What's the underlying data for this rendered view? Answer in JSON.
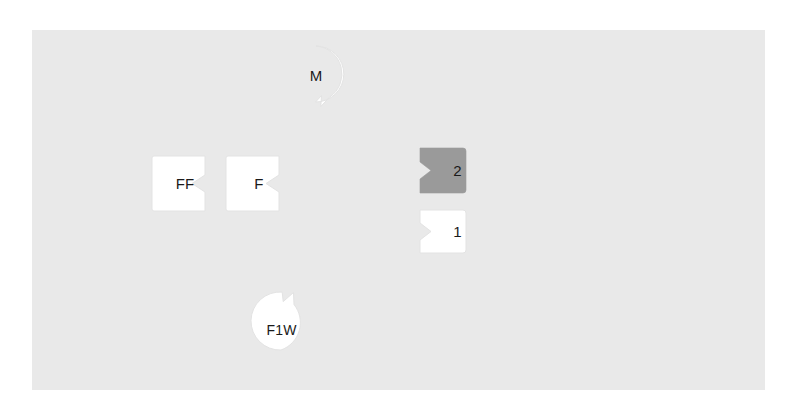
{
  "diagram": {
    "canvas": {
      "width": 798,
      "height": 417,
      "background_color": "#ffffff"
    },
    "panel": {
      "name": "diagram-panel",
      "fill_color": "#e9e9e9",
      "x": 32,
      "y": 30,
      "width": 733,
      "height": 360
    },
    "colors": {
      "panel": "#e9e9e9",
      "shape_white": "#ffffff",
      "shape_gray": "#9a9a9a",
      "shape_stroke": "#e0e0e0",
      "text": "#1a1a1a"
    },
    "nodes": [
      {
        "id": "m",
        "label": "M",
        "shape": "circle-notched-bottom-right",
        "fill": "#ffffff",
        "x": 286,
        "y": 44,
        "width": 60,
        "height": 63
      },
      {
        "id": "ff",
        "label": "FF",
        "shape": "rect-notch-right",
        "fill": "#ffffff",
        "x": 151,
        "y": 155,
        "width": 68,
        "height": 57
      },
      {
        "id": "f",
        "label": "F",
        "shape": "rect-notch-right",
        "fill": "#ffffff",
        "x": 225,
        "y": 155,
        "width": 68,
        "height": 57
      },
      {
        "id": "box2",
        "label": "2",
        "shape": "rect-notch-left",
        "fill": "#9a9a9a",
        "x": 420,
        "y": 147,
        "width": 47,
        "height": 47
      },
      {
        "id": "box1",
        "label": "1",
        "shape": "rect-notch-left",
        "fill": "#ffffff",
        "x": 420,
        "y": 209,
        "width": 47,
        "height": 45
      },
      {
        "id": "f1w",
        "label": "F1W",
        "shape": "circle-notched-top-right",
        "fill": "#ffffff",
        "x": 249,
        "y": 289,
        "width": 65,
        "height": 64
      }
    ]
  }
}
